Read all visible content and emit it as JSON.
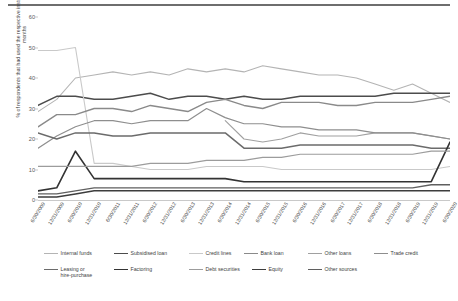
{
  "chart_data": {
    "type": "line",
    "title": "",
    "xlabel": "",
    "ylabel": "% of respondents that had used the respective instrument in the past six months",
    "ylim": [
      0,
      60
    ],
    "ytick_step": 10,
    "yticks": [
      0,
      10,
      20,
      30,
      40,
      50,
      60
    ],
    "grid": false,
    "legend_position": "bottom",
    "categories": [
      "6/30/2009",
      "12/31/2009",
      "6/30/2010",
      "12/31/2010",
      "6/30/2011",
      "12/31/2011",
      "6/30/2012",
      "12/31/2012",
      "6/30/2013",
      "12/31/2013",
      "6/30/2014",
      "12/31/2014",
      "6/30/2015",
      "12/31/2015",
      "6/30/2016",
      "12/31/2016",
      "6/30/2017",
      "12/31/2017",
      "6/30/2018",
      "12/31/2018",
      "6/30/2019",
      "12/31/2019",
      "6/30/2020"
    ],
    "series": [
      {
        "name": "Internal funds",
        "color": "#b4b4b4",
        "width": 1.1,
        "values": [
          29,
          33,
          40,
          41,
          42,
          41,
          42,
          41,
          43,
          42,
          43,
          42,
          44,
          43,
          42,
          41,
          41,
          40,
          38,
          36,
          38,
          35,
          32
        ]
      },
      {
        "name": "Subsidised loan",
        "color": "#4c4c4c",
        "width": 1.5,
        "values": [
          31,
          34,
          34,
          33,
          33,
          34,
          35,
          33,
          34,
          34,
          33,
          34,
          33,
          33,
          34,
          34,
          34,
          34,
          34,
          35,
          35,
          35,
          35
        ]
      },
      {
        "name": "Credit lines",
        "color": "#c9c9c9",
        "width": 1.1,
        "values": [
          49,
          49,
          50,
          12,
          12,
          11,
          10,
          10,
          10,
          11,
          11,
          11,
          11,
          10,
          10,
          10,
          10,
          10,
          10,
          10,
          10,
          10,
          11
        ]
      },
      {
        "name": "Bank loan",
        "color": "#8a8a8a",
        "width": 1.4,
        "values": [
          24,
          28,
          28,
          30,
          30,
          29,
          31,
          30,
          29,
          32,
          33,
          31,
          30,
          32,
          32,
          32,
          31,
          31,
          32,
          32,
          32,
          33,
          34
        ]
      },
      {
        "name": "Other loans",
        "color": "#a0a0a0",
        "width": 1.1,
        "values": [
          null,
          null,
          null,
          null,
          null,
          null,
          null,
          null,
          null,
          null,
          26,
          20,
          19,
          20,
          22,
          21,
          21,
          21,
          22,
          22,
          22,
          21,
          20
        ]
      },
      {
        "name": "Trade credit",
        "color": "#8e8e8e",
        "width": 1.2,
        "values": [
          17,
          21,
          24,
          26,
          26,
          25,
          26,
          26,
          26,
          30,
          27,
          25,
          25,
          24,
          24,
          23,
          23,
          23,
          22,
          22,
          22,
          21,
          20
        ]
      },
      {
        "name": "Leasing or\nhire-purchase",
        "color": "#6b6b6b",
        "width": 1.5,
        "values": [
          22,
          20,
          22,
          22,
          21,
          21,
          22,
          22,
          22,
          22,
          22,
          17,
          17,
          17,
          18,
          18,
          18,
          18,
          18,
          18,
          18,
          17,
          17
        ]
      },
      {
        "name": "Factoring",
        "color": "#333333",
        "width": 1.6,
        "values": [
          3,
          4,
          16,
          7,
          7,
          7,
          7,
          7,
          7,
          7,
          7,
          6,
          6,
          6,
          6,
          6,
          6,
          6,
          6,
          6,
          6,
          6,
          19
        ]
      },
      {
        "name": "Debt securities",
        "color": "#9c9c9c",
        "width": 1.2,
        "values": [
          11,
          11,
          11,
          11,
          11,
          11,
          12,
          12,
          12,
          13,
          13,
          13,
          14,
          14,
          15,
          15,
          15,
          15,
          15,
          15,
          15,
          16,
          16
        ]
      },
      {
        "name": "Equity",
        "color": "#3d3d3d",
        "width": 1.5,
        "values": [
          1,
          1,
          2,
          3,
          3,
          3,
          3,
          3,
          3,
          3,
          3,
          3,
          3,
          3,
          3,
          3,
          3,
          3,
          3,
          3,
          3,
          3,
          3
        ]
      },
      {
        "name": "Other sources",
        "color": "#5f5f5f",
        "width": 1.3,
        "values": [
          2,
          2,
          3,
          4,
          4,
          4,
          4,
          4,
          4,
          4,
          4,
          4,
          4,
          4,
          4,
          4,
          4,
          4,
          4,
          4,
          4,
          5,
          5
        ]
      }
    ]
  },
  "legend": {
    "row1": [
      {
        "label": "Internal funds"
      },
      {
        "label": "Subsidised loan"
      },
      {
        "label": "Credit lines"
      },
      {
        "label": "Bank loan"
      },
      {
        "label": "Other loans"
      },
      {
        "label": "Trade credit"
      }
    ],
    "row2": [
      {
        "label": "Leasing or\nhire-purchase"
      },
      {
        "label": "Factoring"
      },
      {
        "label": "Debt securities"
      },
      {
        "label": "Equity"
      },
      {
        "label": "Other sources"
      }
    ]
  }
}
